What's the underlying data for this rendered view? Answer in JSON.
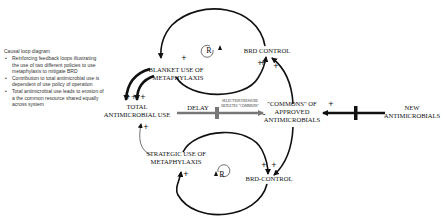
{
  "sidebar": {
    "title": "Causal loop diagram",
    "bullets": [
      "Reinforcing feedback loops illustrating the use of two different policies to use metaphylaxis to mitigate BRD",
      "Contribution to total antimicrobial use is dependent of use policy of operation",
      "Total antimicrobial use leads to erosion of a the common resource shared equally across system"
    ]
  },
  "diagram": {
    "nodes": {
      "blanket_line1": "BLANKET USE OF",
      "blanket_line2": "METAPHYLAXIS",
      "brd_control_top": "BRD CONTROL",
      "total_line1": "TOTAL",
      "total_line2": "ANTIMICROBIAL USE",
      "commons_line1": "\"COMMONS\" OF",
      "commons_line2": "APPROVED",
      "commons_line3": "ANTIMICROBIALS",
      "new_line1": "NEW",
      "new_line2": "ANTIMICROBIALS",
      "strategic_line1": "STRATEGIC USE OF",
      "strategic_line2": "METAPHYLAXIS",
      "brd_control_bottom": "BRD-CONTROL"
    },
    "links": {
      "delay_label": "DELAY",
      "selection_line1": "SELECTION PRESSURE",
      "selection_line2": "DEPLETES \"COMMONS\""
    },
    "loops": {
      "top": "R",
      "bottom": "R"
    },
    "polarity": {
      "plus": "+",
      "minus": "-"
    },
    "colors": {
      "line": "#111111",
      "delay_arrow": "#777777"
    }
  }
}
